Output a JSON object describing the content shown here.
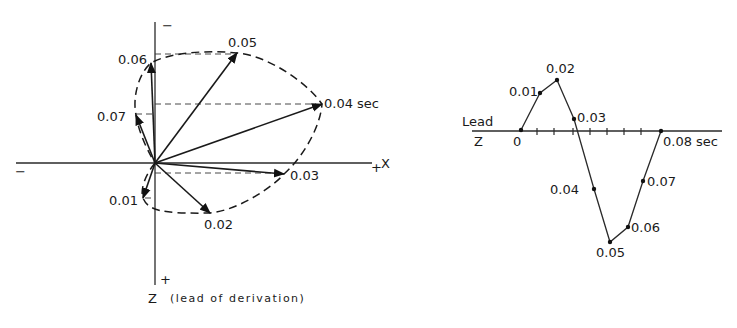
{
  "vectorcardiogram": {
    "axes": {
      "x_label": "X",
      "x_plus": "+",
      "x_minus": "−",
      "z_label": "Z",
      "z_caption": "(lead of derivation)",
      "z_plus": "+",
      "z_minus": "−"
    },
    "vectors": [
      {
        "t": "0.01",
        "label": "0.01",
        "x": 143,
        "y": 198
      },
      {
        "t": "0.02",
        "label": "0.02",
        "x": 210,
        "y": 213
      },
      {
        "t": "0.03",
        "label": "0.03",
        "x": 284,
        "y": 174
      },
      {
        "t": "0.04",
        "label": "0.04 sec",
        "x": 322,
        "y": 104
      },
      {
        "t": "0.05",
        "label": "0.05",
        "x": 237,
        "y": 53
      },
      {
        "t": "0.06",
        "label": "0.06",
        "x": 151,
        "y": 63
      },
      {
        "t": "0.07",
        "label": "0.07",
        "x": 136,
        "y": 115
      }
    ]
  },
  "lead_tracing": {
    "lead_label": "Lead",
    "lead_name": "Z",
    "points": [
      {
        "label": "0",
        "x": 521,
        "y": 130
      },
      {
        "label": "0.01",
        "x": 540,
        "y": 93
      },
      {
        "label": "0.02",
        "x": 557,
        "y": 80
      },
      {
        "label": "0.03",
        "x": 574,
        "y": 119
      },
      {
        "label": "0.04",
        "x": 594,
        "y": 189
      },
      {
        "label": "0.05",
        "x": 610,
        "y": 242
      },
      {
        "label": "0.06",
        "x": 628,
        "y": 227
      },
      {
        "label": "0.07",
        "x": 643,
        "y": 181
      },
      {
        "label": "0.08 sec",
        "x": 661,
        "y": 131
      }
    ]
  }
}
